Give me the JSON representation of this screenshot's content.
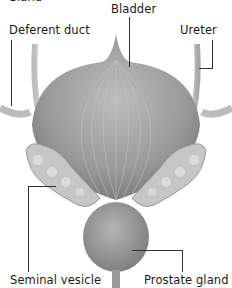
{
  "diagram": {
    "title_partial": "Gland",
    "labels": {
      "bladder": "Bladder",
      "deferent_duct": "Deferent duct",
      "ureter": "Ureter",
      "seminal_vesicle": "Seminal vesicle",
      "prostate_gland": "Prostate gland"
    },
    "colors": {
      "tissue_dark": "#8a8a8a",
      "tissue_light": "#d8d8d8",
      "line": "#333333"
    }
  }
}
